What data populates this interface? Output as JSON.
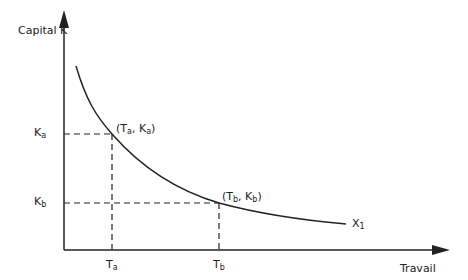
{
  "axes": {
    "y_label": "Capital K",
    "x_label": "Travail"
  },
  "curve": {
    "label_main": "X",
    "label_sub": "1"
  },
  "points": [
    {
      "t_main": "T",
      "t_sub": "a",
      "k_main": "K",
      "k_sub": "a",
      "coord_label": "(T",
      "sep": ", K",
      "close": ")"
    },
    {
      "t_main": "T",
      "t_sub": "b",
      "k_main": "K",
      "k_sub": "b",
      "coord_label": "(T",
      "sep": ", K",
      "close": ")"
    }
  ],
  "colors": {
    "line": "#222222"
  }
}
